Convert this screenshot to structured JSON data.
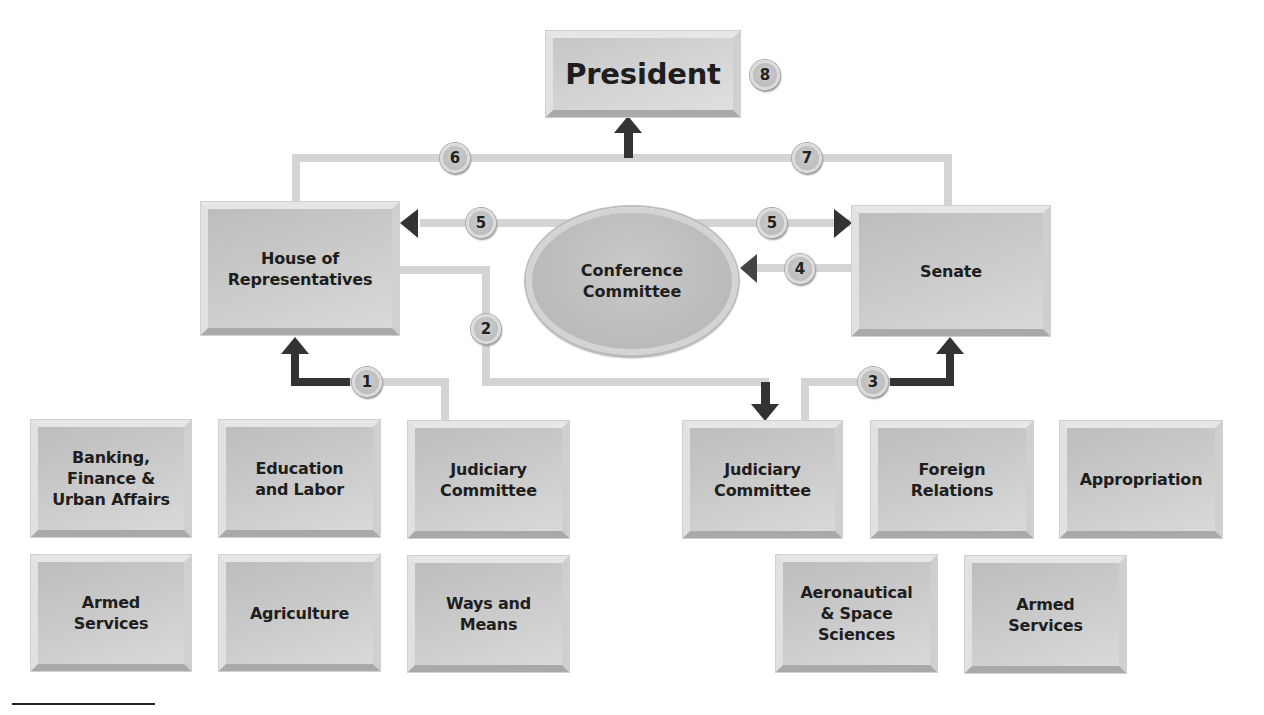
{
  "diagram": {
    "type": "legislative-process-flowchart",
    "nodes": {
      "president": "President",
      "house": "House of\nRepresentatives",
      "senate": "Senate",
      "conference": "Conference\nCommittee"
    },
    "house_committees": [
      {
        "label": "Banking,\nFinance &\nUrban Affairs"
      },
      {
        "label": "Education\nand Labor"
      },
      {
        "label": "Judiciary\nCommittee"
      },
      {
        "label": "Armed\nServices"
      },
      {
        "label": "Agriculture"
      },
      {
        "label": "Ways and\nMeans"
      }
    ],
    "senate_committees": [
      {
        "label": "Judiciary\nCommittee"
      },
      {
        "label": "Foreign\nRelations"
      },
      {
        "label": "Appropriation"
      },
      {
        "label": "Aeronautical\n& Space\nSciences"
      },
      {
        "label": "Armed\nServices"
      }
    ],
    "steps": [
      {
        "number": "1",
        "from": "House Judiciary Committee",
        "to": "House of Representatives"
      },
      {
        "number": "2",
        "from": "House of Representatives",
        "to": "Senate Judiciary Committee"
      },
      {
        "number": "3",
        "from": "Senate Judiciary Committee",
        "to": "Senate"
      },
      {
        "number": "4",
        "from": "Senate",
        "to": "Conference Committee"
      },
      {
        "number": "5",
        "from": "Conference Committee",
        "to": "House of Representatives"
      },
      {
        "number": "5",
        "from": "Conference Committee",
        "to": "Senate"
      },
      {
        "number": "6",
        "from": "House of Representatives",
        "to": "President"
      },
      {
        "number": "7",
        "from": "Senate",
        "to": "President"
      },
      {
        "number": "8",
        "at": "President"
      }
    ]
  },
  "colors": {
    "box_fill": "#c4c4c4",
    "connector_light": "#d2d2d2",
    "connector_dark": "#3a3a3a",
    "text": "#1e1e1e"
  }
}
